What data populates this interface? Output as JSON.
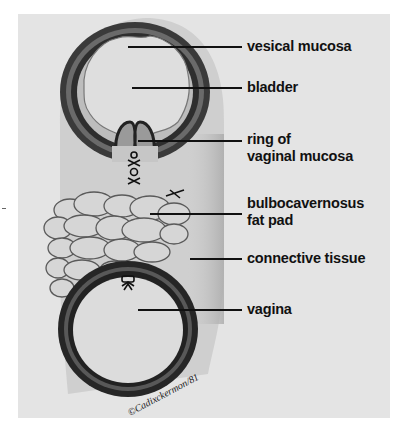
{
  "figure": {
    "background_color": "#e4e4e4",
    "ink_color": "#111111"
  },
  "labels": [
    {
      "id": "vesical-mucosa",
      "text": "vesical mucosa"
    },
    {
      "id": "bladder",
      "text": "bladder"
    },
    {
      "id": "ring-of-vaginal-mucosa",
      "line1": "ring of",
      "line2": "vaginal mucosa"
    },
    {
      "id": "bulbocavernosus-fat-pad",
      "line1": "bulbocavernosus",
      "line2": "fat pad"
    },
    {
      "id": "connective-tissue",
      "text": "connective tissue"
    },
    {
      "id": "vagina",
      "text": "vagina"
    }
  ],
  "signature": "©Cadixckermon/81"
}
